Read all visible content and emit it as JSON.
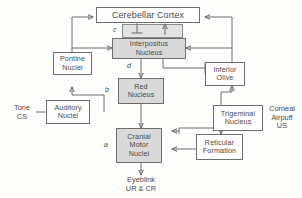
{
  "diagram": {
    "colors": {
      "stroke": "#6d6d6d",
      "text": "#4a4a4a",
      "shaded_fill": "#d9d9d9",
      "plain_fill": "#ffffff",
      "panel_fill": "#e3e3e3",
      "background": "#fdfdfc"
    },
    "nodes": [
      {
        "id": "cerebellar-cortex",
        "label": "Cerebellar Cortex",
        "shaded": false
      },
      {
        "id": "interpositus-nucleus",
        "label": "Interpositus\nNucleus",
        "shaded": true
      },
      {
        "id": "pontine-nuclei",
        "label": "Pontine\nNuclei",
        "shaded": false
      },
      {
        "id": "inferior-olive",
        "label": "Inferior\nOlive",
        "shaded": false
      },
      {
        "id": "red-nucleus",
        "label": "Red\nNucleus",
        "shaded": true
      },
      {
        "id": "auditory-nuclei",
        "label": "Auditory\nNuclei",
        "shaded": false
      },
      {
        "id": "trigeminal-nucleus",
        "label": "Trigeminal\nNucleus",
        "shaded": false
      },
      {
        "id": "cranial-motor-nuclei",
        "label": "Cranial\nMotor\nNuclei",
        "shaded": true
      },
      {
        "id": "reticular-formation",
        "label": "Reticular\nFormation",
        "shaded": false
      }
    ],
    "free_labels": [
      {
        "id": "tone-cs",
        "text": "Tone\nCS"
      },
      {
        "id": "corneal-airpuff-us",
        "text": "Corneal\nAirpuff\nUS"
      },
      {
        "id": "eyeblink-output",
        "text": "Eyeblink\nUR & CR"
      }
    ],
    "site_markers": [
      {
        "id": "marker-a",
        "text": "a"
      },
      {
        "id": "marker-b",
        "text": "b"
      },
      {
        "id": "marker-c",
        "text": "c"
      },
      {
        "id": "marker-d",
        "text": "d"
      }
    ]
  }
}
